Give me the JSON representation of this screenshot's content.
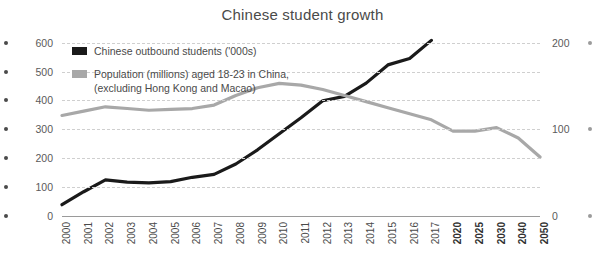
{
  "chart_data": {
    "type": "line",
    "title": "Chinese student growth",
    "xlabel": "",
    "ylabel": "",
    "grid": true,
    "legend_position": "top-left",
    "x": [
      "2000",
      "2001",
      "2002",
      "2003",
      "2004",
      "2005",
      "2006",
      "2007",
      "2008",
      "2009",
      "2010",
      "2011",
      "2012",
      "2013",
      "2014",
      "2015",
      "2016",
      "2017",
      "2020",
      "2025",
      "2030",
      "2040",
      "2050"
    ],
    "xtick_labels": [
      "2000",
      "2001",
      "2002",
      "2003",
      "2004",
      "2005",
      "2006",
      "2007",
      "2008",
      "2009",
      "2010",
      "2011",
      "2012",
      "2013",
      "2014",
      "2015",
      "2016",
      "2017",
      "2020",
      "2025",
      "2030",
      "2040",
      "2050"
    ],
    "xtick_bold": [
      "2020",
      "2025",
      "2030",
      "2040",
      "2050"
    ],
    "left_axis": {
      "ticks": [
        0,
        100,
        200,
        300,
        400,
        500,
        600
      ],
      "ylim": [
        0,
        630
      ],
      "tick_labels": [
        "0",
        "100",
        "200",
        "300",
        "400",
        "500",
        "600"
      ]
    },
    "right_axis": {
      "ticks": [
        0,
        100,
        200
      ],
      "ylim": [
        0,
        210
      ],
      "tick_labels": [
        "0",
        "100",
        "200"
      ]
    },
    "series": [
      {
        "name": "Chinese outbound students ('000s)",
        "color": "#1a1a1a",
        "axis": "left",
        "x": [
          "2000",
          "2001",
          "2002",
          "2003",
          "2004",
          "2005",
          "2006",
          "2007",
          "2008",
          "2009",
          "2010",
          "2011",
          "2012",
          "2013",
          "2014",
          "2015",
          "2016",
          "2017"
        ],
        "values": [
          39,
          84,
          125,
          117,
          115,
          119,
          134,
          144,
          180,
          229,
          285,
          340,
          399,
          414,
          460,
          523,
          545,
          608
        ]
      },
      {
        "name": "Population (millions) aged 18-23 in China, (excluding Hong Kong and Macao)",
        "color": "#a8a8a8",
        "axis": "right",
        "x": [
          "2000",
          "2001",
          "2002",
          "2003",
          "2004",
          "2005",
          "2006",
          "2007",
          "2008",
          "2009",
          "2010",
          "2011",
          "2012",
          "2013",
          "2014",
          "2015",
          "2016",
          "2017",
          "2020",
          "2025",
          "2030",
          "2040",
          "2050"
        ],
        "values": [
          116,
          121,
          126,
          124,
          122,
          123,
          124,
          128,
          139,
          148,
          153,
          151,
          146,
          139,
          132,
          125,
          118,
          111,
          98,
          98,
          102,
          90,
          68
        ]
      }
    ]
  },
  "legend": {
    "items": [
      {
        "label": "Chinese outbound students ('000s)",
        "color": "#1a1a1a"
      },
      {
        "label": "Population (millions) aged 18-23 in China,",
        "label2": "(excluding Hong Kong and Macao)",
        "color": "#a8a8a8"
      }
    ]
  }
}
